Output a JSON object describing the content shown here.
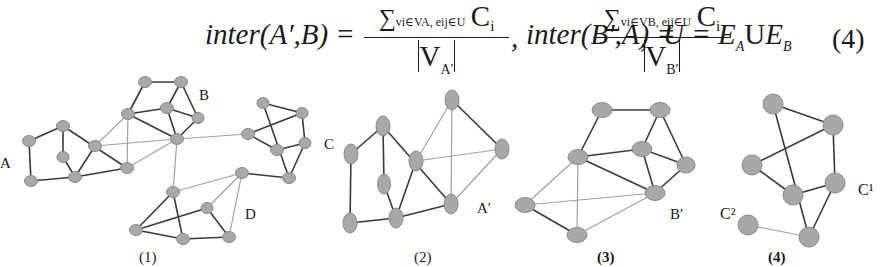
{
  "formula": {
    "lhs1": "inter(A′,B) =",
    "frac1": {
      "sum": "∑",
      "sub": "vi∈VA, eij∈U",
      "term": "C",
      "term_sub": "i",
      "den": "V",
      "den_sub": "A′"
    },
    "sep1": ",",
    "lhs2": "inter(B′,A) =",
    "frac2": {
      "sum": "∑",
      "sub": "vi∈VB, eij∈U",
      "term": "C",
      "term_sub": "i",
      "den": "V",
      "den_sub": "B′"
    },
    "sep2": ",",
    "union": {
      "lhs": "U = E",
      "a_sub": "A",
      "op": "U",
      "rhs": "E",
      "b_sub": "B"
    },
    "equation_number": "(4)"
  },
  "figure": {
    "panels": [
      {
        "caption": "(1)",
        "cluster_labels": [
          "A",
          "B",
          "C",
          "D"
        ]
      },
      {
        "caption": "(2)",
        "cluster_labels": [
          "A′"
        ]
      },
      {
        "caption": "(3)",
        "cluster_labels": [
          "B′"
        ]
      },
      {
        "caption": "(4)",
        "cluster_labels": [
          "C¹",
          "C²"
        ]
      }
    ]
  },
  "colors": {
    "node_fill": "#a8a8a8",
    "dark_edge": "#3a3a3a",
    "light_edge": "#a0a0a0",
    "text": "#1a1a1a"
  }
}
